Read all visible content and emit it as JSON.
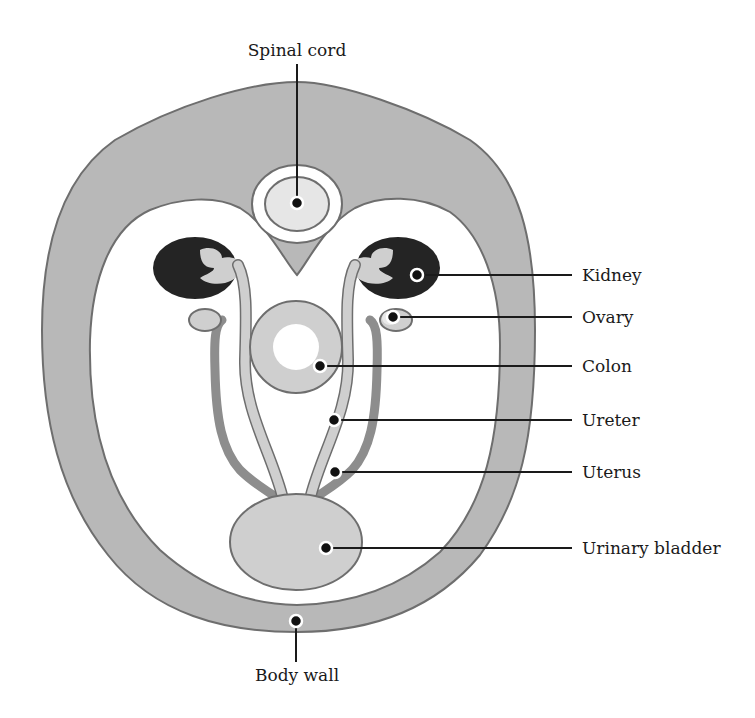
{
  "diagram": {
    "colors": {
      "body_wall": "#b8b8b8",
      "organ_light": "#cfcfcf",
      "organ_mid": "#8d8d8d",
      "kidney": "#242424",
      "outline": "#6e6e6e",
      "background": "#ffffff"
    },
    "labels": {
      "spinal_cord": "Spinal cord",
      "kidney": "Kidney",
      "ovary": "Ovary",
      "colon": "Colon",
      "ureter": "Ureter",
      "uterus": "Uterus",
      "urinary_bladder": "Urinary bladder",
      "body_wall": "Body wall"
    },
    "structures": [
      "Spinal cord",
      "Kidney (paired)",
      "Ovary (paired)",
      "Colon",
      "Ureter (paired)",
      "Uterus (paired horns)",
      "Urinary bladder",
      "Body wall"
    ]
  }
}
